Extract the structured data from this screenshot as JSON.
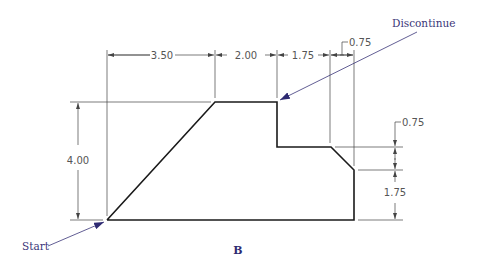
{
  "figure": {
    "caption": "B",
    "labels": {
      "start": "Start",
      "discontinue": "Discontinue"
    },
    "dimensions": {
      "top": [
        {
          "id": "d1",
          "value": "3.50"
        },
        {
          "id": "d2",
          "value": "2.00"
        },
        {
          "id": "d3",
          "value": "1.75"
        },
        {
          "id": "d4",
          "value": "0.75"
        }
      ],
      "left": {
        "value": "4.00"
      },
      "right": [
        {
          "id": "r1",
          "value": "0.75"
        },
        {
          "id": "r2",
          "value": "1.75"
        }
      ]
    },
    "colors": {
      "object_line": "#1a1a1a",
      "dimension_line": "#444444",
      "annotation": "#3a3578"
    }
  }
}
